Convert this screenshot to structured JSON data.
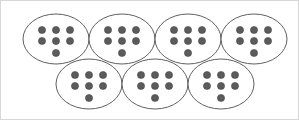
{
  "figure": {
    "background_color": "#ffffff",
    "border_color": "#d8d8d8",
    "width": 299,
    "height": 120
  },
  "style": {
    "oval_fill": "#ffffff",
    "oval_stroke": "#4d4d4d",
    "oval_stroke_width": 0.9,
    "dot_fill": "#5b5b5b",
    "dot_stroke": "#3f3f3f",
    "dot_radius": 3.6
  },
  "chart_data": {
    "type": "diagram",
    "group_count": 7,
    "dots_per_group": 7,
    "total_dots": 49,
    "dot_arrangement": "3 dots top row, 3 dots middle row, 1 dot bottom centered",
    "rows": [
      {
        "row_index": 0,
        "row_label": "top-row",
        "group_count": 4,
        "groups": [
          {
            "id": "group-1",
            "label": "Group 1",
            "dot_count": 7,
            "cx": 55,
            "cy": 38,
            "rx": 33,
            "ry": 25
          },
          {
            "id": "group-2",
            "label": "Group 2",
            "dot_count": 7,
            "cx": 121,
            "cy": 38,
            "rx": 33,
            "ry": 25
          },
          {
            "id": "group-3",
            "label": "Group 3",
            "dot_count": 7,
            "cx": 187,
            "cy": 38,
            "rx": 33,
            "ry": 25
          },
          {
            "id": "group-4",
            "label": "Group 4",
            "dot_count": 7,
            "cx": 253,
            "cy": 38,
            "rx": 33,
            "ry": 25
          }
        ]
      },
      {
        "row_index": 1,
        "row_label": "bottom-row",
        "group_count": 3,
        "groups": [
          {
            "id": "group-5",
            "label": "Group 5",
            "dot_count": 7,
            "cx": 88,
            "cy": 83,
            "rx": 33,
            "ry": 25
          },
          {
            "id": "group-6",
            "label": "Group 6",
            "dot_count": 7,
            "cx": 154,
            "cy": 83,
            "rx": 33,
            "ry": 25
          },
          {
            "id": "group-7",
            "label": "Group 7",
            "dot_count": 7,
            "cx": 220,
            "cy": 83,
            "rx": 33,
            "ry": 25
          }
        ]
      }
    ],
    "dot_offsets": [
      {
        "dx": -14,
        "dy": -9
      },
      {
        "dx": 0,
        "dy": -9
      },
      {
        "dx": 14,
        "dy": -9
      },
      {
        "dx": -14,
        "dy": 2
      },
      {
        "dx": 0,
        "dy": 2
      },
      {
        "dx": 14,
        "dy": 2
      },
      {
        "dx": 0,
        "dy": 14
      }
    ]
  }
}
